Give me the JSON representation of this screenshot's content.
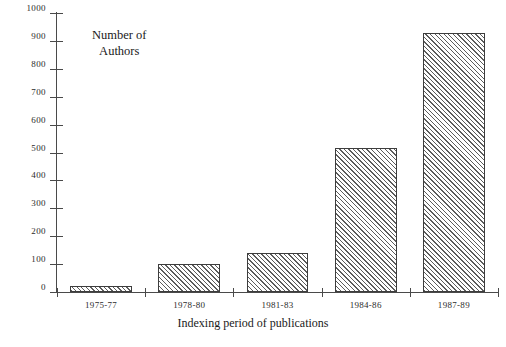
{
  "chart_data": {
    "type": "bar",
    "title": "",
    "categories": [
      "1975-77",
      "1978-80",
      "1981-83",
      "1984-86",
      "1987-89"
    ],
    "values": [
      20,
      100,
      140,
      515,
      930
    ],
    "xlabel": "Indexing period of publications",
    "ylabel": "Number of\nAuthors",
    "ylabel_lines": [
      "Number of",
      "Authors"
    ],
    "ylim": [
      0,
      1000
    ],
    "ytick_values": [
      0,
      100,
      200,
      300,
      400,
      500,
      600,
      700,
      800,
      900,
      1000
    ],
    "ytick_labels": [
      "0",
      "100",
      "200",
      "300",
      "400",
      "500",
      "600",
      "700",
      "800",
      "900",
      "1000"
    ],
    "grid": false,
    "legend": false,
    "bar_fill": "hatched-diagonal",
    "bar_color": "#5c5c5c",
    "axis_color": "#4a4a4a",
    "background": "#ffffff"
  }
}
